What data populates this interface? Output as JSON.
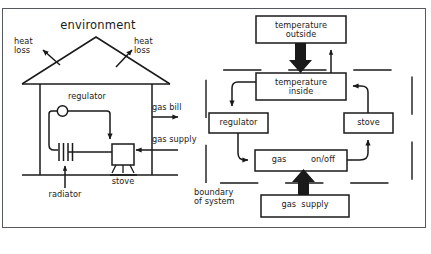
{
  "figure": {
    "title": "",
    "colors": {
      "ink": "#1a1a1a",
      "frame": "#55585c",
      "paper": "#ffffff"
    }
  },
  "left_panel": {
    "name": "house-heating-schematic",
    "heading": "environment",
    "labels": {
      "heat_loss_left": "heat\nloss",
      "heat_loss_right": "heat\nloss",
      "regulator": "regulator",
      "gas_bill": "gas bill",
      "gas_supply": "gas supply",
      "radiator": "radiator",
      "stove": "stove"
    }
  },
  "right_panel": {
    "name": "block-diagram",
    "boxes": [
      {
        "id": "temperature-outside",
        "label": "temperature\noutside"
      },
      {
        "id": "temperature-inside",
        "label": "temperature\ninside"
      },
      {
        "id": "regulator",
        "label": "regulator"
      },
      {
        "id": "stove",
        "label": "stove"
      },
      {
        "id": "gas-on-off",
        "label_left": "gas",
        "label_right": "on/off"
      },
      {
        "id": "gas-supply",
        "label": "gas  supply"
      }
    ],
    "boundary_label": "boundary\nof system"
  }
}
